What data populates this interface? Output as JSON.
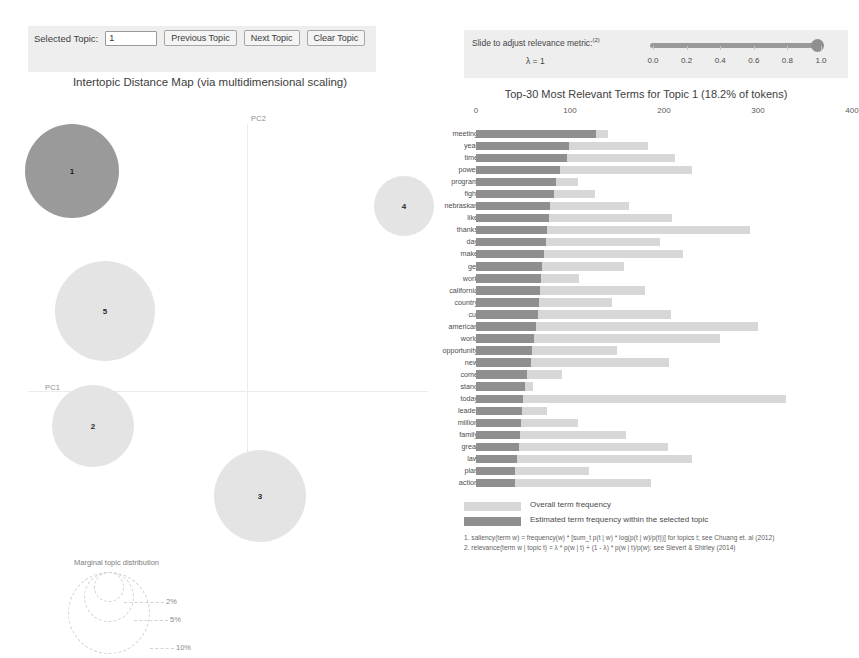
{
  "topic_selector": {
    "label": "Selected Topic:",
    "value": "1",
    "placeholder": "",
    "previous_label": "Previous Topic",
    "next_label": "Next Topic",
    "clear_label": "Clear Topic"
  },
  "mds": {
    "title": "Intertopic Distance Map (via multidimensional scaling)",
    "x_axis_label": "PC1",
    "y_axis_label": "PC2",
    "selected_color": "#9a9a9a",
    "unselected_color": "#e4e4e4",
    "topics": [
      {
        "id": "1",
        "cx": 52,
        "cy": 75,
        "r": 47,
        "selected": true
      },
      {
        "id": "4",
        "cx": 384,
        "cy": 110,
        "r": 30,
        "selected": false
      },
      {
        "id": "5",
        "cx": 85,
        "cy": 215,
        "r": 50,
        "selected": false
      },
      {
        "id": "2",
        "cx": 73,
        "cy": 330,
        "r": 41,
        "selected": false
      },
      {
        "id": "3",
        "cx": 240,
        "cy": 400,
        "r": 46,
        "selected": false
      }
    ],
    "marginal_legend": {
      "title": "Marginal topic distribution",
      "ticks": [
        "2%",
        "5%",
        "10%"
      ]
    }
  },
  "lambda_control": {
    "label": "Slide to adjust relevance metric:",
    "footnote_marker": "(2)",
    "value_label": "λ = 1",
    "value": 1.0,
    "ticks": [
      "0.0",
      "0.2",
      "0.4",
      "0.6",
      "0.8",
      "1.0"
    ]
  },
  "bar_chart_meta": {
    "legend": [
      {
        "label": "Overall term frequency",
        "color": "#d7d7d7"
      },
      {
        "label": "Estimated term frequency within the selected topic",
        "color": "#8f8f8f"
      }
    ],
    "footnotes": [
      "1. saliency(term w) = frequency(w) * [sum_t p(t | w) * log(p(t | w)/p(t))] for topics t; see Chuang et. al (2012)",
      "2. relevance(term w | topic t) = λ * p(w | t) + (1 - λ) * p(w | t)/p(w); see Sievert & Shirley (2014)"
    ]
  },
  "chart_data": {
    "type": "bar",
    "title": "Top-30 Most Relevant Terms for Topic 1 (18.2% of tokens)",
    "xlabel": "",
    "ylabel": "",
    "xlim": [
      0,
      400
    ],
    "ticks": [
      0,
      100,
      200,
      300,
      400
    ],
    "grid": false,
    "orientation": "horizontal",
    "legend_position": "bottom",
    "categories": [
      "meeting",
      "year",
      "time",
      "power",
      "program",
      "fight",
      "nebraskan",
      "like",
      "thanks",
      "day",
      "make",
      "get",
      "work",
      "california",
      "country",
      "cut",
      "american",
      "world",
      "opportunity",
      "new",
      "come",
      "stand",
      "today",
      "leader",
      "million",
      "family",
      "great",
      "law",
      "plan",
      "action"
    ],
    "series": [
      {
        "name": "Overall term frequency",
        "color": "#d7d7d7",
        "values": [
          140,
          183,
          212,
          230,
          108,
          127,
          163,
          209,
          292,
          196,
          220,
          157,
          110,
          180,
          145,
          207,
          300,
          260,
          150,
          205,
          92,
          61,
          330,
          76,
          108,
          160,
          204,
          230,
          120,
          186
        ]
      },
      {
        "name": "Estimated term frequency within the selected topic",
        "color": "#8f8f8f",
        "values": [
          128,
          99,
          97,
          89,
          85,
          83,
          79,
          78,
          75,
          74,
          72,
          70,
          69,
          68,
          67,
          66,
          64,
          62,
          60,
          58,
          54,
          52,
          50,
          49,
          48,
          47,
          46,
          44,
          42,
          41
        ]
      }
    ]
  }
}
